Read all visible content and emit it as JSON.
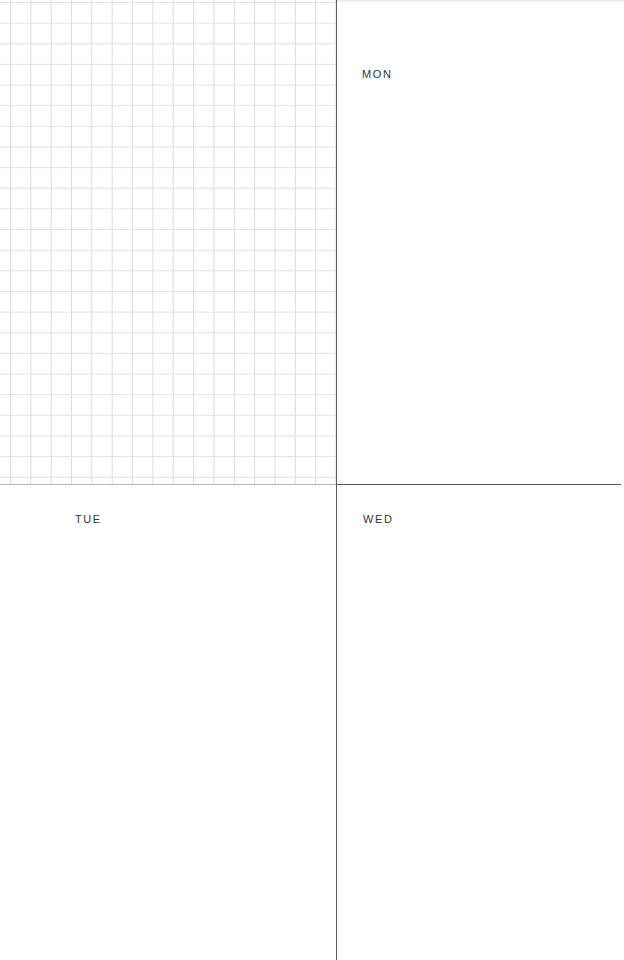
{
  "planner": {
    "notes_panel": {
      "style": "grid",
      "grid_color": "#dcdcdc"
    },
    "days": [
      {
        "label": "MON"
      },
      {
        "label": "TUE"
      },
      {
        "label": "WED"
      }
    ],
    "colors": {
      "divider": "#5a5a5a",
      "label_text": "#333333",
      "background": "#ffffff"
    }
  }
}
